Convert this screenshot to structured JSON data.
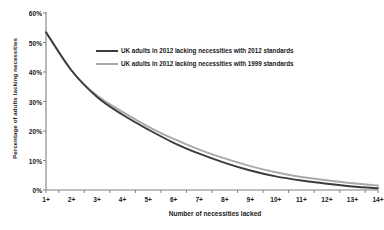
{
  "chart_data": {
    "type": "line",
    "title": "",
    "xlabel": "Number of necessities lacked",
    "ylabel": "Percentage of adults lacking necessities",
    "categories": [
      "1+",
      "2+",
      "3+",
      "4+",
      "5+",
      "6+",
      "7+",
      "8+",
      "9+",
      "10+",
      "11+",
      "12+",
      "13+",
      "14+"
    ],
    "ylim": [
      0,
      60
    ],
    "ytick_labels": [
      "0%",
      "10%",
      "20%",
      "30%",
      "40%",
      "50%",
      "60%"
    ],
    "ytick_values": [
      0,
      10,
      20,
      30,
      40,
      50,
      60
    ],
    "grid": false,
    "legend_position": "inside-top-center",
    "series": [
      {
        "name": "UK adults in 2012 lacking necessities with 2012 standards",
        "color": "#3b3b3b",
        "values": [
          53.5,
          40.5,
          31.5,
          25.5,
          20.5,
          16.0,
          12.3,
          9.2,
          6.6,
          4.6,
          3.2,
          2.1,
          1.2,
          0.6
        ]
      },
      {
        "name": "UK adults in 2012 lacking necessities with 1999 standards",
        "color": "#a9a9a9",
        "values": [
          53.5,
          40.5,
          32.0,
          26.5,
          21.5,
          17.3,
          13.7,
          10.7,
          8.1,
          6.0,
          4.4,
          3.3,
          2.3,
          1.5
        ]
      }
    ]
  },
  "axis": {
    "line_color": "#808080"
  }
}
